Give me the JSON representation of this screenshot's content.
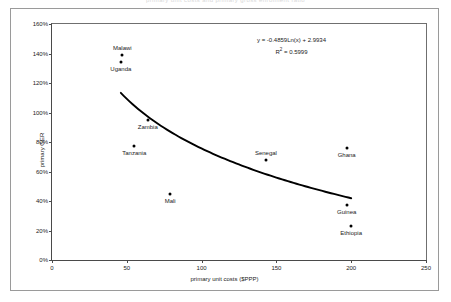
{
  "clipped_title": "primary unit costs and primary gross enrolment ratio",
  "chart_data": {
    "type": "scatter",
    "title": "",
    "xlabel": "primary unit costs ($PPP)",
    "ylabel": "primary GER",
    "xlim": [
      0,
      250
    ],
    "ylim": [
      0,
      160
    ],
    "xticks": [
      "0",
      "50",
      "100",
      "150",
      "200",
      "250"
    ],
    "xtick_values": [
      0,
      50,
      100,
      150,
      200,
      250
    ],
    "yticks": [
      "0%",
      "20%",
      "40%",
      "60%",
      "80%",
      "100%",
      "120%",
      "140%",
      "160%"
    ],
    "ytick_values": [
      0,
      20,
      40,
      60,
      80,
      100,
      120,
      140,
      160
    ],
    "grid": false,
    "legend": false,
    "points": [
      {
        "label": "Malawi",
        "x": 47,
        "y": 139,
        "label_pos": "above"
      },
      {
        "label": "Uganda",
        "x": 46,
        "y": 134,
        "label_pos": "below"
      },
      {
        "label": "Zambia",
        "x": 64,
        "y": 95,
        "label_pos": "below"
      },
      {
        "label": "Tanzania",
        "x": 55,
        "y": 77,
        "label_pos": "below"
      },
      {
        "label": "Mali",
        "x": 79,
        "y": 45,
        "label_pos": "below"
      },
      {
        "label": "Senegal",
        "x": 143,
        "y": 68,
        "label_pos": "above"
      },
      {
        "label": "Ghana",
        "x": 197,
        "y": 76,
        "label_pos": "below"
      },
      {
        "label": "Guinea",
        "x": 197,
        "y": 37,
        "label_pos": "below"
      },
      {
        "label": "Ethiopia",
        "x": 200,
        "y": 23,
        "label_pos": "below"
      }
    ],
    "trendline": {
      "type": "logarithmic",
      "equation": "y = -0.4859Ln(x) + 2.9934",
      "r_squared_label": "R",
      "r_squared_sup": "2",
      "r_squared_value": " = 0.5999",
      "coef_a": -0.4859,
      "coef_b": 2.9934,
      "x_start": 46,
      "x_end": 200
    }
  },
  "colors": {
    "point": "#000000",
    "trendline": "#000000",
    "axis": "#4a4a4a",
    "frame": "#9a9a9a"
  }
}
